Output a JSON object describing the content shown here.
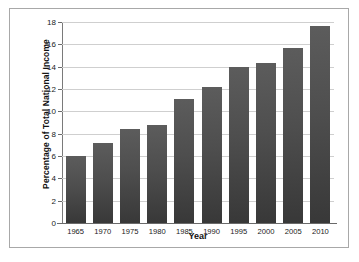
{
  "chart_data": {
    "type": "bar",
    "title": "",
    "subtitle": "",
    "xlabel": "Year",
    "ylabel": "Percentage of Total National Income",
    "categories": [
      "1965",
      "1970",
      "1975",
      "1980",
      "1985",
      "1990",
      "1995",
      "2000",
      "2005",
      "2010"
    ],
    "values": [
      6.0,
      7.2,
      8.4,
      8.8,
      11.1,
      12.2,
      14.0,
      14.3,
      15.7,
      17.6
    ],
    "ylim": [
      0,
      18
    ],
    "yticks": [
      0,
      2,
      4,
      6,
      8,
      10,
      12,
      14,
      16,
      18
    ],
    "ytick_labels": [
      "0",
      "2",
      "4",
      "6",
      "8",
      "10",
      "12",
      "14",
      "16",
      "18"
    ],
    "grid": true,
    "legend": false,
    "legend_position": "none",
    "bar_color": "#4a4a4a",
    "gridline_color": "#cfcfcf",
    "axis_color": "#6a6a6a",
    "frame_color": "#a8a8a8",
    "background": "#ffffff"
  }
}
